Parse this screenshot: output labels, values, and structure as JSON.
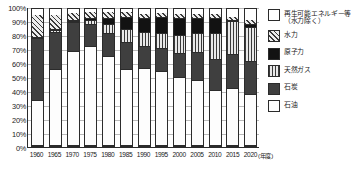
{
  "axes": {
    "y_ticks": [
      "100%",
      "90%",
      "80%",
      "70%",
      "60%",
      "50%",
      "40%",
      "30%",
      "20%",
      "10%",
      "0%"
    ],
    "x_unit_label": "(年度)"
  },
  "legend": {
    "items": [
      {
        "key": "renew",
        "label": "再生可能エネルギー等\n（水力除く）",
        "pattern": "f-renew"
      },
      {
        "key": "hydro",
        "label": "水力",
        "pattern": "f-hydro"
      },
      {
        "key": "nuclear",
        "label": "原子力",
        "pattern": "f-nuclear"
      },
      {
        "key": "gas",
        "label": "天然ガス",
        "pattern": "f-gas"
      },
      {
        "key": "coal",
        "label": "石炭",
        "pattern": "f-coal"
      },
      {
        "key": "oil",
        "label": "石油",
        "pattern": "f-oil"
      }
    ]
  },
  "chart_data": {
    "type": "bar",
    "subtype": "stacked-100-percent",
    "title": "",
    "xlabel": "(年度)",
    "ylabel": "",
    "ylim": [
      0,
      100
    ],
    "grid": true,
    "legend_position": "right",
    "categories": [
      "1960",
      "1965",
      "1970",
      "1975",
      "1980",
      "1985",
      "1990",
      "1995",
      "2000",
      "2005",
      "2010",
      "2015",
      "2020"
    ],
    "series": [
      {
        "name": "石油",
        "key": "oil",
        "values": [
          33.0,
          55.5,
          69.0,
          72.0,
          65.0,
          55.5,
          56.0,
          54.0,
          49.5,
          47.5,
          40.5,
          42.0,
          37.0
        ]
      },
      {
        "name": "石炭",
        "key": "coal",
        "values": [
          45.0,
          27.5,
          21.0,
          16.5,
          17.0,
          19.5,
          16.5,
          16.5,
          17.5,
          20.5,
          22.5,
          25.0,
          24.5
        ]
      },
      {
        "name": "天然ガス",
        "key": "gas",
        "values": [
          1.0,
          1.5,
          1.0,
          2.5,
          6.0,
          9.5,
          10.0,
          11.0,
          13.0,
          14.0,
          18.5,
          23.5,
          25.0
        ]
      },
      {
        "name": "原子力",
        "key": "nuclear",
        "values": [
          0.0,
          0.2,
          0.4,
          1.5,
          4.7,
          8.9,
          10.0,
          12.0,
          13.0,
          11.0,
          11.5,
          0.4,
          1.8
        ]
      },
      {
        "name": "水力",
        "key": "hydro",
        "values": [
          17.0,
          11.0,
          5.6,
          5.0,
          4.8,
          4.7,
          4.2,
          3.3,
          3.4,
          3.1,
          3.3,
          3.3,
          3.7
        ]
      },
      {
        "name": "再生可能エネルギー等（水力除く）",
        "key": "renew",
        "values": [
          4.0,
          4.3,
          3.0,
          2.5,
          2.5,
          1.9,
          3.3,
          3.2,
          3.6,
          3.9,
          3.7,
          5.8,
          8.0
        ]
      }
    ]
  }
}
